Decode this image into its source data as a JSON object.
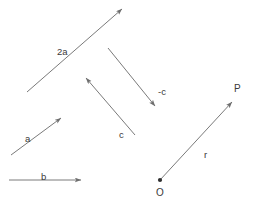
{
  "figure": {
    "width": 254,
    "height": 204,
    "background_color": "#ffffff",
    "stroke_color": "#7a7a7a",
    "text_color": "#3a3a3a"
  },
  "chart_data": {
    "type": "diagram",
    "title": "",
    "xlabel": "",
    "ylabel": "",
    "grid": false,
    "legend": "none",
    "vectors": [
      {
        "label": "2a",
        "x1": 27,
        "y1": 92,
        "x2": 122,
        "y2": 9,
        "label_x": 57,
        "label_y": 47
      },
      {
        "label": "a",
        "x1": 11,
        "y1": 155,
        "x2": 61,
        "y2": 118,
        "label_x": 25,
        "label_y": 134
      },
      {
        "label": "b",
        "x1": 9,
        "y1": 180,
        "x2": 81,
        "y2": 180,
        "label_x": 41,
        "label_y": 172
      },
      {
        "label": "c",
        "x1": 135,
        "y1": 135,
        "x2": 86,
        "y2": 78,
        "label_x": 119,
        "label_y": 130
      },
      {
        "label": "-c",
        "x1": 108,
        "y1": 48,
        "x2": 155,
        "y2": 106,
        "label_x": 158,
        "label_y": 87
      },
      {
        "label": "r",
        "x1": 160,
        "y1": 180,
        "x2": 232,
        "y2": 102,
        "label_x": 204,
        "label_y": 150
      }
    ],
    "points": [
      {
        "label": "O",
        "x": 160,
        "y": 180,
        "marker": "filled-dot",
        "label_x": 156,
        "label_y": 188
      },
      {
        "label": "P",
        "x": 236,
        "y": 97,
        "marker": "none",
        "label_x": 234,
        "label_y": 84
      }
    ]
  },
  "labels": {
    "two_a": "2a",
    "a": "a",
    "b": "b",
    "c": "c",
    "minus_c": "-c",
    "r": "r",
    "origin": "O",
    "point_p": "P"
  }
}
